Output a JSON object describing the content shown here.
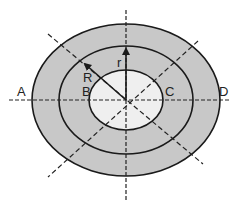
{
  "diagram": {
    "type": "concentric-ellipses",
    "center": [
      126,
      100
    ],
    "colors": {
      "outer_ring_fill": "#c8c8c8",
      "inner_fill": "#efefef",
      "stroke": "#1a1a1a",
      "axis": "#222222",
      "background": "#ffffff"
    },
    "ellipses": [
      {
        "name": "outer",
        "rx": 94,
        "ry": 76
      },
      {
        "name": "middle",
        "rx": 67,
        "ry": 54
      },
      {
        "name": "inner",
        "rx": 37,
        "ry": 30
      }
    ],
    "labels": {
      "A": "A",
      "B": "B",
      "C": "C",
      "D": "D",
      "R": "R",
      "r": "r"
    }
  }
}
